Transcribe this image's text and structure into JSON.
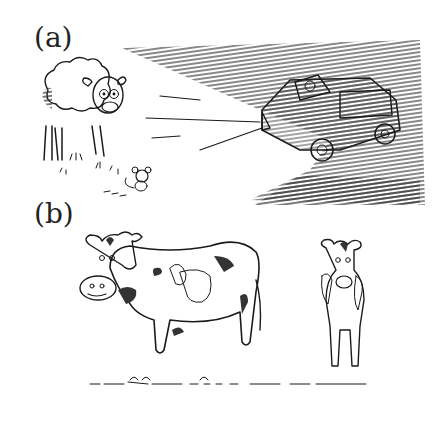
{
  "panels": [
    {
      "label": "(a)",
      "description": "Sheep and mouse in the headlights of an approaching car at night"
    },
    {
      "label": "(b)",
      "description": "Two spotted cows standing on grass, one in side view, one facing forward"
    }
  ],
  "colors": {
    "ink": "#1a1a1a",
    "background": "#ffffff",
    "hatch": "#333333"
  }
}
